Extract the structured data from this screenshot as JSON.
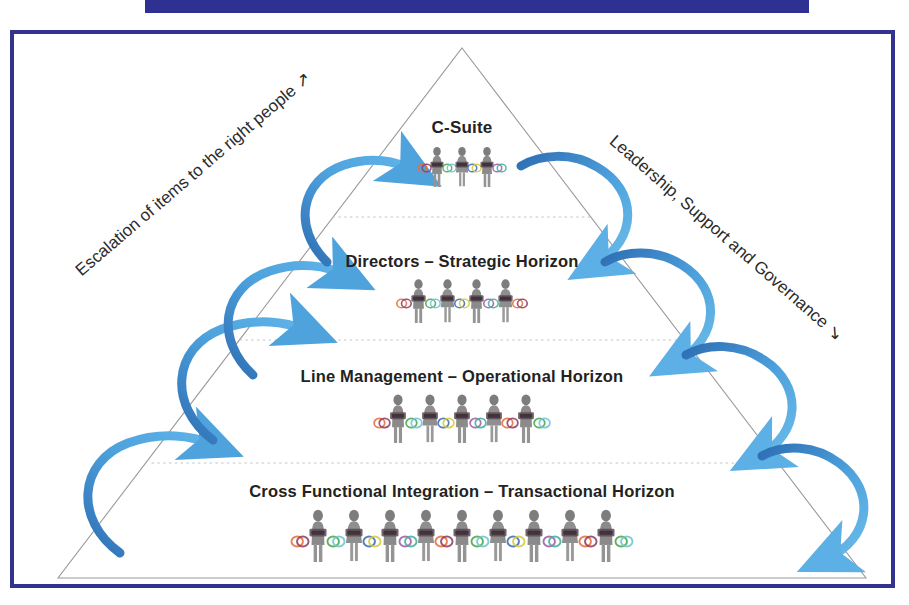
{
  "document": {
    "title": "Organisational Hierarchy Pyramid",
    "top_bar_color": "#2e3192",
    "frame_color": "#31338f",
    "background_color": "#ffffff"
  },
  "pyramid": {
    "apex": {
      "x": 462,
      "y": 48
    },
    "base_left": {
      "x": 58,
      "y": 578
    },
    "base_right": {
      "x": 866,
      "y": 578
    },
    "outline_color": "#9a9a9a",
    "divider_color": "#c9c9c9",
    "divider_y": [
      217,
      340,
      463
    ],
    "tiers": [
      {
        "id": "c-suite",
        "label": "C-Suite",
        "people_count": 3,
        "person_scale": 0.72
      },
      {
        "id": "directors",
        "label": "Directors – Strategic Horizon",
        "people_count": 4,
        "person_scale": 0.8
      },
      {
        "id": "line-management",
        "label": "Line Management – Operational Horizon",
        "people_count": 5,
        "person_scale": 0.88
      },
      {
        "id": "cross-functional",
        "label": "Cross Functional Integration – Transactional Horizon",
        "people_count": 9,
        "person_scale": 0.95
      }
    ]
  },
  "captions": {
    "left": {
      "text": "Escalation of items to the right people",
      "arrow": "↗",
      "rotation_deg": -40.5
    },
    "right": {
      "text": "Leadership, Support and Governance",
      "arrow": "↘",
      "rotation_deg": 41
    }
  },
  "arrows": {
    "color_light": "#4ea3dd",
    "color_dark": "#2f6fb5",
    "left_direction": "up",
    "right_direction": "down",
    "left_count": 4,
    "right_count": 4
  },
  "chain_colors": [
    "#e8703a",
    "#8e3f66",
    "#4aa84a",
    "#6fc4dd",
    "#3b6fb5",
    "#d8c93a",
    "#a05fa8",
    "#3fb2a0"
  ]
}
